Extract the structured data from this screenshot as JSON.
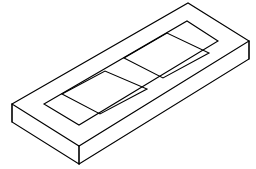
{
  "drawing": {
    "title": "Isometric rectangular slab with two rectangular slots",
    "subject": "isometric-technical-drawing",
    "projection": "isometric",
    "line_color": "#000000",
    "fill_color": "#ffffff",
    "background_color": "#ffffff",
    "line_width": 1.1,
    "canvas": {
      "width": 256,
      "height": 169
    },
    "labels": [],
    "dimensions_shown": false,
    "annotations_shown": false
  },
  "geometry": {
    "slab_top_face": {
      "name": "top-face",
      "vertices": [
        {
          "name": "left",
          "x": 12,
          "y": 104
        },
        {
          "name": "back",
          "x": 188,
          "y": 3
        },
        {
          "name": "right",
          "x": 249,
          "y": 41
        },
        {
          "name": "front",
          "x": 79,
          "y": 146
        }
      ]
    },
    "slab_thickness": 18,
    "slab_front_left_face": {
      "name": "front-left-face",
      "vertices": [
        {
          "x": 12,
          "y": 104
        },
        {
          "x": 79,
          "y": 146
        },
        {
          "x": 79,
          "y": 164
        },
        {
          "x": 12,
          "y": 122
        }
      ]
    },
    "slab_front_right_face": {
      "name": "front-right-face",
      "vertices": [
        {
          "x": 79,
          "y": 146
        },
        {
          "x": 249,
          "y": 41
        },
        {
          "x": 249,
          "y": 59
        },
        {
          "x": 79,
          "y": 164
        }
      ]
    },
    "top_face_inset_border": {
      "name": "inset-rim-outline",
      "vertices": [
        {
          "x": 44,
          "y": 104
        },
        {
          "x": 187,
          "y": 21
        },
        {
          "x": 218,
          "y": 41
        },
        {
          "x": 79,
          "y": 125
        }
      ]
    },
    "slot_left": {
      "name": "left-rectangular-slot",
      "vertices": [
        {
          "name": "left",
          "x": 62,
          "y": 94
        },
        {
          "name": "top",
          "x": 105,
          "y": 71
        },
        {
          "name": "right",
          "x": 147,
          "y": 89
        },
        {
          "name": "bottom",
          "x": 100,
          "y": 114
        }
      ]
    },
    "slot_right": {
      "name": "right-rectangular-slot",
      "vertices": [
        {
          "name": "left",
          "x": 124,
          "y": 58
        },
        {
          "name": "top",
          "x": 167,
          "y": 33
        },
        {
          "name": "right",
          "x": 209,
          "y": 53
        },
        {
          "name": "bottom",
          "x": 163,
          "y": 78
        }
      ]
    }
  },
  "meta": {
    "shape_count": 2,
    "slot_count": 2,
    "text_present": false
  }
}
